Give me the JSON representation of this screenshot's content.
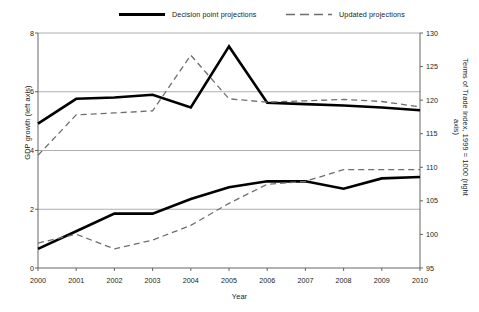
{
  "chart_data": {
    "type": "line",
    "title": "",
    "xlabel": "Year",
    "ylabel": "GDP growth (left axis)",
    "ylabel_right": "Terms of Trade Index, 1999 = 1000 (right axis)",
    "x": [
      2000,
      2001,
      2002,
      2003,
      2004,
      2005,
      2006,
      2007,
      2008,
      2009,
      2010
    ],
    "xtick_labels": [
      "2000",
      "2001",
      "2002",
      "2003",
      "2004",
      "2005",
      "2006",
      "2007",
      "2008",
      "2009",
      "2010"
    ],
    "ylim": [
      0,
      8
    ],
    "ytick_labels": [
      "0",
      "2",
      "4",
      "6",
      "8"
    ],
    "ytick_values": [
      0,
      2,
      4,
      6,
      8
    ],
    "ylim_right": [
      95,
      130
    ],
    "ytick_labels_right": [
      "95",
      "100",
      "105",
      "110",
      "115",
      "120",
      "125",
      "130"
    ],
    "ytick_values_right": [
      95,
      100,
      105,
      110,
      115,
      120,
      125,
      130
    ],
    "grid": "horizontal",
    "legend_position": "top",
    "series": [
      {
        "name": "Decision point projections",
        "style": "solid",
        "color": "#000000",
        "axis": "right",
        "group": "terms-of-trade",
        "values": [
          116.5,
          120.2,
          120.4,
          120.8,
          118.9,
          128.0,
          119.6,
          119.4,
          119.2,
          118.9,
          118.5
        ]
      },
      {
        "name": "Updated projections",
        "style": "dashed",
        "color": "#6e6e6e",
        "axis": "right",
        "group": "terms-of-trade",
        "values": [
          111.8,
          117.8,
          118.1,
          118.4,
          126.7,
          120.2,
          119.7,
          119.9,
          120.1,
          119.8,
          119.0
        ]
      },
      {
        "name": "Decision point projections",
        "style": "solid",
        "color": "#000000",
        "axis": "left",
        "group": "gdp-growth",
        "values": [
          0.65,
          1.25,
          1.85,
          1.85,
          2.35,
          2.75,
          2.95,
          2.95,
          2.7,
          3.05,
          3.1
        ]
      },
      {
        "name": "Updated projections",
        "style": "dashed",
        "color": "#6e6e6e",
        "axis": "left",
        "group": "gdp-growth",
        "values": [
          0.85,
          1.15,
          0.65,
          0.95,
          1.45,
          2.2,
          2.85,
          2.95,
          3.35,
          3.35,
          3.35
        ]
      }
    ],
    "legend": [
      {
        "label": "Decision point projections",
        "style": "solid"
      },
      {
        "label": "Updated projections",
        "style": "dashed"
      }
    ],
    "colors": {
      "solid": "#000000",
      "dashed": "#6e6e6e",
      "grid": "#9a9a9a",
      "axis": "#555555",
      "background": "#ffffff"
    }
  }
}
